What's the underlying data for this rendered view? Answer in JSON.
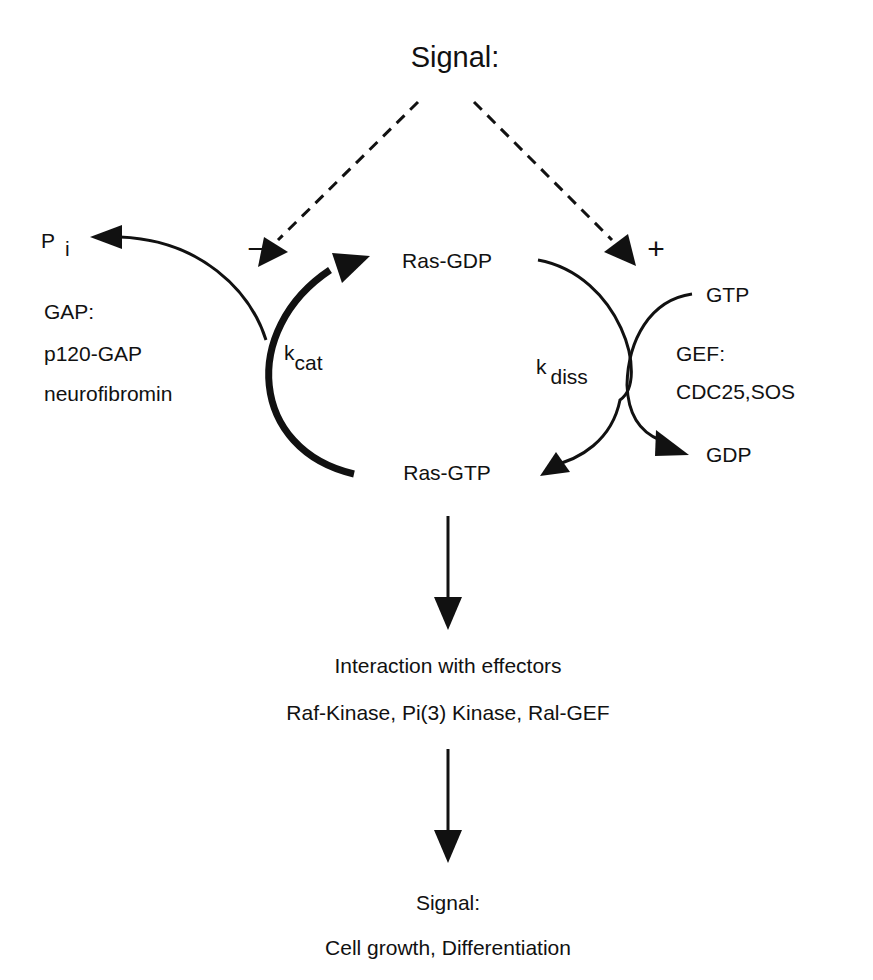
{
  "diagram": {
    "top_signal": "Signal:",
    "inhibit_sign": "−",
    "activate_sign": "+",
    "ras_gdp": "Ras-GDP",
    "ras_gtp": "Ras-GTP",
    "gap": {
      "product_main": "P",
      "product_sub": "i",
      "title": "GAP:",
      "members": [
        "p120-GAP",
        "neurofibromin"
      ],
      "rate_main": "k",
      "rate_sub": "cat"
    },
    "gef": {
      "input": "GTP",
      "output": "GDP",
      "title": "GEF:",
      "members": [
        "CDC25,SOS"
      ],
      "rate_main": "k",
      "rate_sub": "diss"
    },
    "effectors": {
      "title": "Interaction with effectors",
      "list": "Raf-Kinase, Pi(3) Kinase, Ral-GEF"
    },
    "bottom_signal": {
      "title": "Signal:",
      "outcome": "Cell growth, Differentiation"
    },
    "colors": {
      "ink": "#111111",
      "background": "#ffffff"
    }
  }
}
